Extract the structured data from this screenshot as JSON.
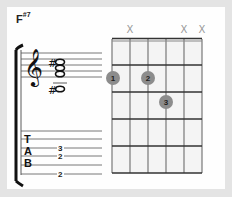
{
  "chord": {
    "name": "F",
    "modifier": "#7",
    "full_name": "F#7"
  },
  "fretboard": {
    "strings": 6,
    "frets": 5,
    "string_markers": [
      {
        "string": 1,
        "marker": ""
      },
      {
        "string": 2,
        "marker": "X"
      },
      {
        "string": 3,
        "marker": ""
      },
      {
        "string": 4,
        "marker": ""
      },
      {
        "string": 5,
        "marker": "X"
      },
      {
        "string": 6,
        "marker": "X"
      }
    ],
    "finger_dots": [
      {
        "finger": "1",
        "string": 1,
        "fret": 2
      },
      {
        "finger": "2",
        "string": 3,
        "fret": 2
      },
      {
        "finger": "3",
        "string": 4,
        "fret": 3
      }
    ],
    "colors": {
      "dot": "#8c8c8c",
      "dot_text": "#1e1e1e",
      "grid": "#333333",
      "cell": "#f4f4f4"
    }
  },
  "notation": {
    "clef": "treble",
    "notes": [
      {
        "accidental": "#",
        "position": "upper"
      },
      {
        "accidental": "",
        "position": "middle"
      },
      {
        "accidental": "",
        "position": "lower"
      },
      {
        "accidental": "#",
        "position": "ledger-below"
      }
    ]
  },
  "tab": {
    "label": [
      "T",
      "A",
      "B"
    ],
    "lines": [
      {
        "line": 1,
        "value": ""
      },
      {
        "line": 2,
        "value": ""
      },
      {
        "line": 3,
        "value": "3"
      },
      {
        "line": 4,
        "value": "2"
      },
      {
        "line": 5,
        "value": ""
      },
      {
        "line": 6,
        "value": "2"
      }
    ]
  }
}
